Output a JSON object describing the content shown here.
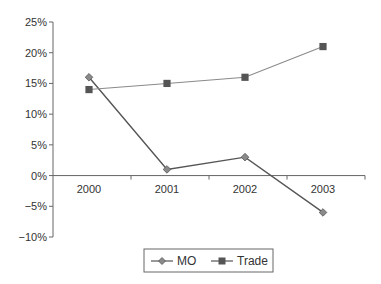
{
  "chart_data": {
    "type": "line",
    "title": "",
    "xlabel": "",
    "ylabel": "",
    "categories": [
      "2000",
      "2001",
      "2002",
      "2003"
    ],
    "series": [
      {
        "name": "MO",
        "marker": "diamond",
        "color": "#555555",
        "marker_color": "#8a8a8a",
        "values": [
          16,
          1,
          3,
          -6
        ]
      },
      {
        "name": "Trade",
        "marker": "square",
        "color": "#8a8a8a",
        "marker_color": "#555555",
        "values": [
          14,
          15,
          16,
          21
        ]
      }
    ],
    "ylim": [
      -10,
      25
    ],
    "yticks": [
      25,
      20,
      15,
      10,
      5,
      0,
      -5,
      -10
    ],
    "ytick_labels": [
      "25%",
      "20%",
      "15%",
      "10%",
      "5%",
      "0%",
      "−5%",
      "−10%"
    ],
    "y_format": "percent",
    "grid": false,
    "legend_position": "bottom"
  },
  "legend": {
    "items": [
      {
        "label": "MO",
        "icon": "diamond-marker-icon"
      },
      {
        "label": "Trade",
        "icon": "square-marker-icon"
      }
    ]
  }
}
